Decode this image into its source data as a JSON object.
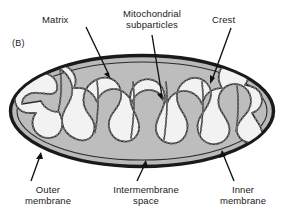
{
  "figure": {
    "panel_label": "(B)",
    "colors": {
      "outline": "#1a1a1a",
      "intermembrane_space_fill": "#b9b9b9",
      "matrix_fill": "#f2f2f2",
      "cristae_outline": "#2a2a2a",
      "subparticle_dots": "#6e6e6e",
      "background": "#ffffff",
      "label_text": "#1a1a1a",
      "leader_line": "#111111"
    }
  },
  "labels": {
    "matrix": "Matrix",
    "subparticles_line1": "Mitochondrial",
    "subparticles_line2": "subparticles",
    "crest": "Crest",
    "outer_line1": "Outer",
    "outer_line2": "membrane",
    "intermembrane_line1": "Intermembrane",
    "intermembrane_line2": "space",
    "inner_line1": "Inner",
    "inner_line2": "membrane"
  },
  "callouts": [
    {
      "name": "matrix",
      "from": [
        86,
        27
      ],
      "to": [
        111,
        79
      ]
    },
    {
      "name": "subparticles",
      "from": [
        152,
        35
      ],
      "to": [
        163,
        101
      ]
    },
    {
      "name": "crest",
      "from": [
        231,
        28
      ],
      "to": [
        210,
        84
      ]
    },
    {
      "name": "outer",
      "from": [
        31,
        181
      ],
      "to": [
        41,
        152
      ]
    },
    {
      "name": "intermembrane",
      "from": [
        137,
        181
      ],
      "to": [
        146,
        160
      ]
    },
    {
      "name": "inner",
      "from": [
        234,
        181
      ],
      "to": [
        222,
        150
      ]
    }
  ],
  "geometry": {
    "ellipse_center": [
      142,
      111
    ],
    "ellipse_radius_x": 133,
    "ellipse_radius_y": 57,
    "outer_membrane_stroke": 3.2,
    "intermembrane_band": 9
  }
}
